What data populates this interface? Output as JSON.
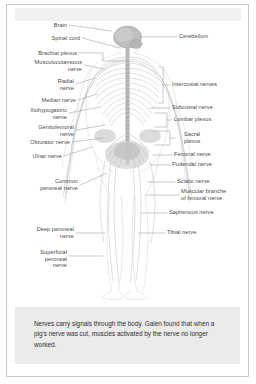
{
  "figure": {
    "background_color": "#ffffff",
    "border_color": "#c9c9c9",
    "label_color": "#4a4a4a",
    "leader_color": "#9a9a9a",
    "anatomy_color": "#cfcfcf"
  },
  "labels_left": [
    {
      "name": "brain",
      "text": "Brain"
    },
    {
      "name": "spinal-cord",
      "text": "Spinal cord"
    },
    {
      "name": "brachial-plexus",
      "text": "Brachial plexus"
    },
    {
      "name": "musculocutaneous-nerve",
      "text": "Musculocutaneous\nnerve"
    },
    {
      "name": "radial-nerve",
      "text": "Radial\nnerve"
    },
    {
      "name": "median-nerve",
      "text": "Median nerve"
    },
    {
      "name": "iliohypogastric-nerve",
      "text": "Iliohypogastric\nnerve"
    },
    {
      "name": "genitofemoral-nerve",
      "text": "Genitofemoral\nnerve"
    },
    {
      "name": "obturator-nerve",
      "text": "Obturator nerve"
    },
    {
      "name": "ulnar-nerve",
      "text": "Ulnar nerve"
    },
    {
      "name": "common-peroneal-nerve",
      "text": "Common\nperoneal nerve"
    },
    {
      "name": "deep-peroneal-nerve",
      "text": "Deep peroneal\nnerve"
    },
    {
      "name": "superficial-peroneal-nerve",
      "text": "Superficial\nperoneal\nnerve"
    }
  ],
  "labels_right": [
    {
      "name": "cerebellum",
      "text": "Cerebellum"
    },
    {
      "name": "intercostal-nerves",
      "text": "Intercostal nerves"
    },
    {
      "name": "subcostal-nerve",
      "text": "Subcostal nerve"
    },
    {
      "name": "lumbar-plexus",
      "text": "Lumbar plexus"
    },
    {
      "name": "sacral-plexus",
      "text": "Sacral\nplexus"
    },
    {
      "name": "femoral-nerve",
      "text": "Femoral nerve"
    },
    {
      "name": "pudendal-nerve",
      "text": "Pudendal nerve"
    },
    {
      "name": "sciatic-nerve",
      "text": "Sciatic nerve"
    },
    {
      "name": "muscular-branch-of-femoral-nerve",
      "text": "Muscular branche\nof femoral nerve"
    },
    {
      "name": "saphenous-nerve",
      "text": "Saphenous nerve"
    },
    {
      "name": "tibial-nerve",
      "text": "Tibial nerve"
    }
  ],
  "caption": {
    "text": "Nerves carry signals through the body. Galen found that when a pig's nerve was cut, muscles activated by the nerve no longer worked.",
    "background_color": "#ebebeb"
  }
}
